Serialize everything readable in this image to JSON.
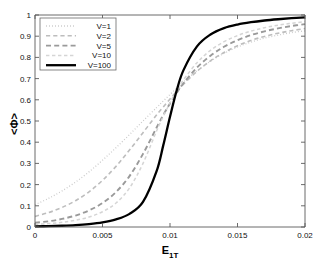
{
  "chart_data": {
    "type": "line",
    "title": "",
    "xlabel": "E_1T",
    "xlabel_base": "E",
    "xlabel_sub": "1T",
    "ylabel": "<Φ>",
    "xlim": [
      0,
      0.02
    ],
    "ylim": [
      0,
      1
    ],
    "grid": false,
    "legend_position": "upper left",
    "xticks": [
      0,
      0.005,
      0.01,
      0.015,
      0.02
    ],
    "xtick_labels": [
      "0",
      "0.005",
      "0.01",
      "0.015",
      "0.02"
    ],
    "yticks": [
      0,
      0.1,
      0.2,
      0.3,
      0.4,
      0.5,
      0.6,
      0.7,
      0.8,
      0.9,
      1
    ],
    "ytick_labels": [
      "0",
      "0.1",
      "0.2",
      "0.3",
      "0.4",
      "0.5",
      "0.6",
      "0.7",
      "0.8",
      "0.9",
      "1"
    ],
    "x": [
      0,
      0.001,
      0.002,
      0.003,
      0.004,
      0.005,
      0.006,
      0.007,
      0.008,
      0.009,
      0.0095,
      0.01,
      0.0105,
      0.011,
      0.012,
      0.013,
      0.014,
      0.015,
      0.016,
      0.017,
      0.018,
      0.019,
      0.02
    ],
    "series": [
      {
        "name": "V=1",
        "label": "V=1",
        "style": "dotted",
        "color": "#c8c8c8",
        "width": 1.3,
        "dash": "0.9,2.1",
        "values": [
          0.105,
          0.135,
          0.17,
          0.212,
          0.26,
          0.315,
          0.374,
          0.436,
          0.5,
          0.563,
          0.594,
          0.625,
          0.655,
          0.684,
          0.737,
          0.782,
          0.819,
          0.849,
          0.872,
          0.891,
          0.905,
          0.917,
          0.925
        ]
      },
      {
        "name": "V=2",
        "label": "V=2",
        "style": "dashed",
        "color": "#bdbdbd",
        "width": 1.6,
        "dash": "4.2,3.0",
        "values": [
          0.05,
          0.068,
          0.092,
          0.124,
          0.166,
          0.22,
          0.286,
          0.363,
          0.445,
          0.528,
          0.566,
          0.604,
          0.64,
          0.674,
          0.734,
          0.784,
          0.823,
          0.855,
          0.88,
          0.899,
          0.914,
          0.926,
          0.936
        ]
      },
      {
        "name": "V=5",
        "label": "V=5",
        "style": "dashed",
        "color": "#9a9a9a",
        "width": 1.9,
        "dash": "5.0,3.2",
        "values": [
          0.02,
          0.027,
          0.038,
          0.054,
          0.078,
          0.113,
          0.165,
          0.24,
          0.345,
          0.468,
          0.528,
          0.583,
          0.633,
          0.678,
          0.752,
          0.808,
          0.85,
          0.881,
          0.905,
          0.923,
          0.937,
          0.948,
          0.957
        ]
      },
      {
        "name": "V=10",
        "label": "V=10",
        "style": "dotted",
        "color": "#d5d5d5",
        "width": 1.5,
        "dash": "3.4,2.6",
        "values": [
          0.012,
          0.016,
          0.022,
          0.032,
          0.047,
          0.072,
          0.113,
          0.184,
          0.3,
          0.452,
          0.522,
          0.585,
          0.643,
          0.694,
          0.775,
          0.833,
          0.874,
          0.903,
          0.924,
          0.94,
          0.952,
          0.961,
          0.969
        ]
      },
      {
        "name": "V=100",
        "label": "V=100",
        "style": "solid",
        "color": "#000000",
        "width": 2.3,
        "dash": "",
        "values": [
          0.003,
          0.004,
          0.006,
          0.009,
          0.014,
          0.022,
          0.036,
          0.062,
          0.118,
          0.262,
          0.385,
          0.52,
          0.645,
          0.74,
          0.852,
          0.908,
          0.938,
          0.955,
          0.966,
          0.974,
          0.98,
          0.985,
          0.989
        ]
      }
    ]
  },
  "legend": {
    "entries": [
      {
        "label": "V=1"
      },
      {
        "label": "V=2"
      },
      {
        "label": "V=5"
      },
      {
        "label": "V=10"
      },
      {
        "label": "V=100"
      }
    ]
  }
}
